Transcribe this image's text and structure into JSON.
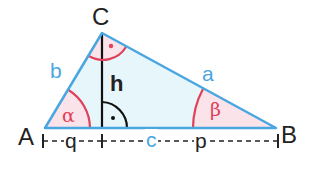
{
  "diagram": {
    "type": "right-triangle",
    "vertices": {
      "A": "A",
      "B": "B",
      "C": "C"
    },
    "sides": {
      "a": "a",
      "b": "b",
      "c": "c"
    },
    "altitude": "h",
    "segments": {
      "q": "q",
      "p": "p"
    },
    "angles": {
      "alpha": "α",
      "beta": "β"
    },
    "colors": {
      "side": "#4aa6e0",
      "fill": "#e6f6fb",
      "angle": "#e0405a",
      "angle_fill": "#fbe3ea",
      "text": "#222222"
    }
  }
}
